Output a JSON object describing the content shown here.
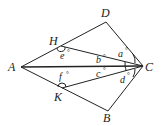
{
  "diagram": {
    "type": "geometry",
    "points": {
      "A": {
        "label": "A",
        "x": 21,
        "y": 67
      },
      "B": {
        "label": "B",
        "x": 108,
        "y": 111
      },
      "C": {
        "label": "C",
        "x": 143,
        "y": 66
      },
      "D": {
        "label": "D",
        "x": 106,
        "y": 22
      },
      "H": {
        "label": "H",
        "x": 61,
        "y": 46
      },
      "K": {
        "label": "K",
        "x": 62,
        "y": 88
      }
    },
    "segments": [
      "AD",
      "DC",
      "AB",
      "BC",
      "AC",
      "HC",
      "KC"
    ],
    "angles": {
      "a": {
        "label": "a",
        "deg": "°"
      },
      "b": {
        "label": "b",
        "deg": "°"
      },
      "c": {
        "label": "c",
        "deg": "°"
      },
      "d": {
        "label": "d",
        "deg": "°"
      },
      "e": {
        "label": "e",
        "deg": "°"
      },
      "f": {
        "label": "f",
        "deg": "°"
      }
    },
    "stroke_color": "#222222"
  }
}
